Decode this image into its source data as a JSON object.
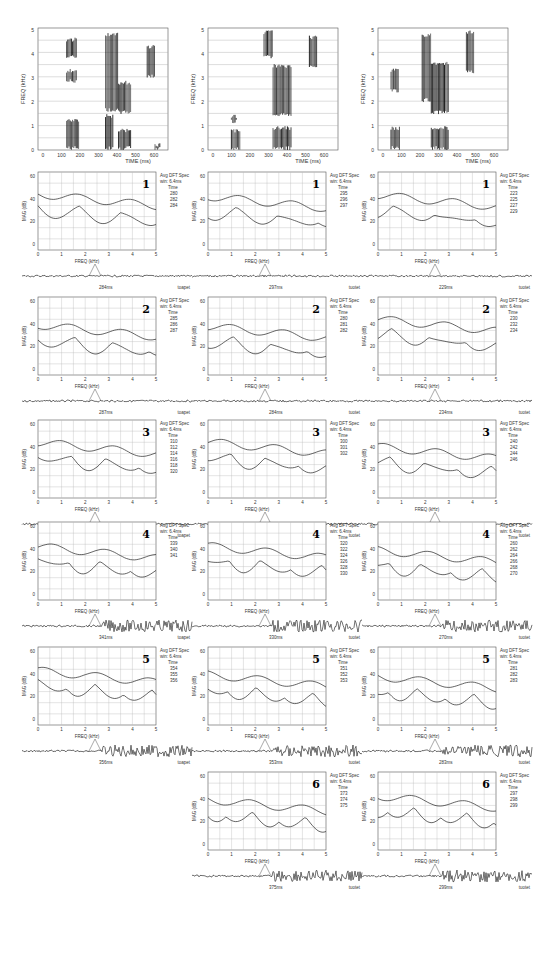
{
  "figure": {
    "columns": [
      {
        "id": "left",
        "word": "toapet",
        "spectrogram": {
          "ylabel": "FREQ (kHz)",
          "xlabel": "TIME (ms)",
          "yticks": [
            "0",
            "1",
            "2",
            "3",
            "4",
            "5"
          ],
          "xticks": [
            "0",
            "100",
            "200",
            "300",
            "400",
            "500",
            "600"
          ]
        },
        "panels": [
          {
            "number": "1",
            "header": "Avg DFT Spec",
            "win": "win: 6.4ms",
            "time_label": "Time",
            "times": [
              "280",
              "282",
              "284"
            ],
            "cursor_ms": "284ms"
          },
          {
            "number": "2",
            "header": "Avg DFT Spec",
            "win": "win: 6.4ms",
            "time_label": "Time",
            "times": [
              "285",
              "286",
              "287"
            ],
            "cursor_ms": "287ms"
          },
          {
            "number": "3",
            "header": "Avg DFT Spec",
            "win": "win: 6.4ms",
            "time_label": "Time",
            "times": [
              "310",
              "312",
              "314",
              "316",
              "318",
              "320"
            ],
            "cursor_ms": "300ms"
          },
          {
            "number": "4",
            "header": "Avg DFT Spec",
            "win": "win: 6.4ms",
            "time_label": "Time",
            "times": [
              "339",
              "340",
              "341"
            ],
            "cursor_ms": "341ms"
          },
          {
            "number": "5",
            "header": "Avg DFT Spec",
            "win": "win: 6.4ms",
            "time_label": "Time",
            "times": [
              "354",
              "355",
              "356"
            ],
            "cursor_ms": "356ms"
          }
        ]
      },
      {
        "id": "middle",
        "word": "tuotet",
        "spectrogram": {
          "ylabel": "FREQ (kHz)",
          "xlabel": "TIME (ms)",
          "yticks": [
            "0",
            "1",
            "2",
            "3",
            "4",
            "5"
          ],
          "xticks": [
            "0",
            "100",
            "200",
            "300",
            "400",
            "500",
            "600"
          ]
        },
        "panels": [
          {
            "number": "1",
            "header": "Avg DFT Spec",
            "win": "win: 6.4ms",
            "time_label": "Time",
            "times": [
              "295",
              "296",
              "297"
            ],
            "cursor_ms": "297ms"
          },
          {
            "number": "2",
            "header": "Avg DFT Spec",
            "win": "win: 6.4ms",
            "time_label": "Time",
            "times": [
              "280",
              "281",
              "282"
            ],
            "cursor_ms": "284ms"
          },
          {
            "number": "3",
            "header": "Avg DFT Spec",
            "win": "win: 6.4ms",
            "time_label": "Time",
            "times": [
              "300",
              "301",
              "302"
            ],
            "cursor_ms": "302ms"
          },
          {
            "number": "4",
            "header": "Avg DFT Spec",
            "win": "win: 6.4ms",
            "time_label": "Time",
            "times": [
              "320",
              "322",
              "324",
              "326",
              "328",
              "330"
            ],
            "cursor_ms": "330ms"
          },
          {
            "number": "5",
            "header": "Avg DFT Spec",
            "win": "win: 6.4ms",
            "time_label": "Time",
            "times": [
              "351",
              "352",
              "353"
            ],
            "cursor_ms": "353ms"
          },
          {
            "number": "6",
            "header": "Avg DFT Spec",
            "win": "win: 6.4ms",
            "time_label": "Time",
            "times": [
              "373",
              "374",
              "375"
            ],
            "cursor_ms": "375ms"
          }
        ]
      },
      {
        "id": "right",
        "word": "tuotet",
        "spectrogram": {
          "ylabel": "FREQ (kHz)",
          "xlabel": "TIME (ms)",
          "yticks": [
            "0",
            "1",
            "2",
            "3",
            "4",
            "5"
          ],
          "xticks": [
            "0",
            "100",
            "200",
            "300",
            "400",
            "500",
            "600"
          ]
        },
        "panels": [
          {
            "number": "1",
            "header": "Avg DFT Spec",
            "win": "win: 6.4ms",
            "time_label": "Time",
            "times": [
              "223",
              "225",
              "227",
              "229"
            ],
            "cursor_ms": "229ms"
          },
          {
            "number": "2",
            "header": "Avg DFT Spec",
            "win": "win: 6.4ms",
            "time_label": "Time",
            "times": [
              "230",
              "232",
              "234"
            ],
            "cursor_ms": "234ms"
          },
          {
            "number": "3",
            "header": "Avg DFT Spec",
            "win": "win: 6.4ms",
            "time_label": "Time",
            "times": [
              "240",
              "242",
              "244",
              "246"
            ],
            "cursor_ms": "246ms"
          },
          {
            "number": "4",
            "header": "Avg DFT Spec",
            "win": "win: 6.4ms",
            "time_label": "Time",
            "times": [
              "260",
              "262",
              "264",
              "266",
              "268",
              "270"
            ],
            "cursor_ms": "270ms"
          },
          {
            "number": "5",
            "header": "Avg DFT Spec",
            "win": "win: 6.4ms",
            "time_label": "Time",
            "times": [
              "281",
              "282",
              "283"
            ],
            "cursor_ms": "283ms"
          },
          {
            "number": "6",
            "header": "Avg DFT Spec",
            "win": "win: 6.4ms",
            "time_label": "Time",
            "times": [
              "297",
              "298",
              "299"
            ],
            "cursor_ms": "299ms"
          }
        ]
      }
    ],
    "spectrum_axes": {
      "ylabel": "MAG (dB)",
      "xlabel": "FREQ (kHz)",
      "yticks": [
        "0",
        "20",
        "40",
        "60"
      ],
      "xticks": [
        "0",
        "1",
        "2",
        "3",
        "4",
        "5"
      ]
    }
  },
  "chart_data": [
    {
      "type": "heatmap",
      "title": "Spectrogram toapet",
      "xlabel": "TIME (ms)",
      "ylabel": "FREQ (kHz)",
      "xlim": [
        0,
        650
      ],
      "ylim": [
        0,
        5
      ]
    },
    {
      "type": "heatmap",
      "title": "Spectrogram tuotet (1)",
      "xlabel": "TIME (ms)",
      "ylabel": "FREQ (kHz)",
      "xlim": [
        0,
        650
      ],
      "ylim": [
        0,
        5
      ]
    },
    {
      "type": "heatmap",
      "title": "Spectrogram tuotet (2)",
      "xlabel": "TIME (ms)",
      "ylabel": "FREQ (kHz)",
      "xlim": [
        0,
        650
      ],
      "ylim": [
        0,
        5
      ]
    },
    {
      "type": "line",
      "title": "Avg DFT Spectra",
      "xlabel": "FREQ (kHz)",
      "ylabel": "MAG (dB)",
      "xlim": [
        0,
        5
      ],
      "ylim": [
        -5,
        70
      ],
      "grid": true,
      "series": [
        {
          "name": "upper envelope"
        },
        {
          "name": "lower spectrum"
        }
      ]
    }
  ]
}
